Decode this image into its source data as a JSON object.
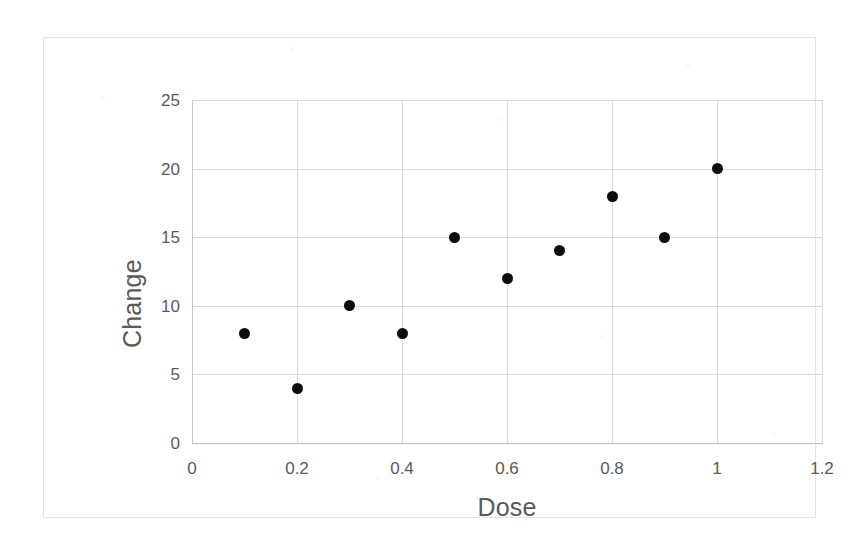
{
  "chart_data": {
    "type": "scatter",
    "title": "",
    "xlabel": "Dose",
    "ylabel": "Change",
    "xlim": [
      0,
      1.2
    ],
    "ylim": [
      0,
      25
    ],
    "x_ticks": [
      "0",
      "0.2",
      "0.4",
      "0.6",
      "0.8",
      "1",
      "1.2"
    ],
    "x_tick_values": [
      0,
      0.2,
      0.4,
      0.6,
      0.8,
      1,
      1.2
    ],
    "y_ticks": [
      "0",
      "5",
      "10",
      "15",
      "20",
      "25"
    ],
    "y_tick_values": [
      0,
      5,
      10,
      15,
      20,
      25
    ],
    "grid": true,
    "legend": "none",
    "marker": {
      "shape": "circle",
      "color": "#0d0d0d",
      "size_px": 11
    },
    "series": [
      {
        "name": "Change vs Dose",
        "x": [
          0.1,
          0.2,
          0.3,
          0.4,
          0.5,
          0.6,
          0.7,
          0.8,
          0.9,
          1.0
        ],
        "y": [
          8,
          4,
          10,
          8,
          15,
          12,
          14,
          18,
          15,
          20
        ]
      }
    ],
    "points": [
      {
        "x": 0.1,
        "y": 8
      },
      {
        "x": 0.2,
        "y": 4
      },
      {
        "x": 0.3,
        "y": 10
      },
      {
        "x": 0.4,
        "y": 8
      },
      {
        "x": 0.5,
        "y": 15
      },
      {
        "x": 0.6,
        "y": 12
      },
      {
        "x": 0.7,
        "y": 14
      },
      {
        "x": 0.8,
        "y": 18
      },
      {
        "x": 0.9,
        "y": 15
      },
      {
        "x": 1.0,
        "y": 20
      }
    ]
  },
  "colors": {
    "marker": "#0d0d0d",
    "gridline": "#d9d9dc",
    "axis": "#bdbdc2",
    "text": "#595959",
    "frame": "#e3e3e5",
    "background": "#ffffff"
  }
}
